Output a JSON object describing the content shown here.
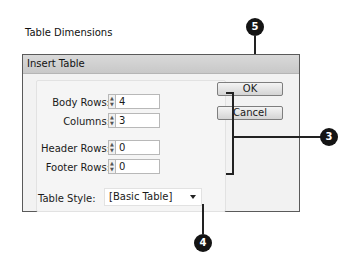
{
  "dialog": {
    "title": "Insert Table",
    "group_label": "Table Dimensions",
    "fields": [
      {
        "label": "Body Rows:",
        "value": "4"
      },
      {
        "label": "Columns:",
        "value": "3"
      },
      {
        "label": "Header Rows:",
        "value": "0"
      },
      {
        "label": "Footer Rows:",
        "value": "0"
      }
    ],
    "table_style_label": "Table Style:",
    "table_style_value": "[Basic Table]",
    "ok_label": "OK",
    "cancel_label": "Cancel"
  },
  "callouts": {
    "ok": "5",
    "fields": "3",
    "style": "4"
  }
}
